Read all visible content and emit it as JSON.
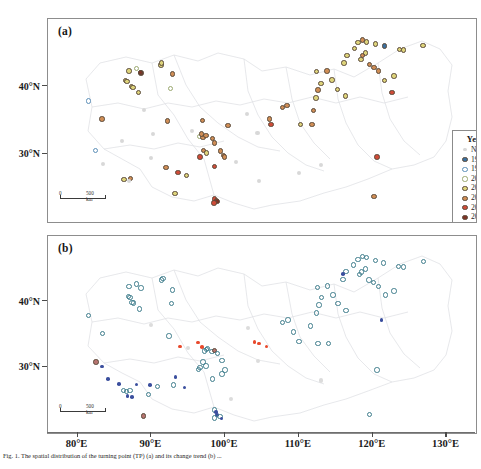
{
  "figure": {
    "panel_a_label": "(a)",
    "panel_b_label": "(b)",
    "scalebar_zero": "0",
    "scalebar_len": "500 km",
    "caption": "Fig. 1.  The spatial distribution of the turning point (TP) (a) and its change trend (b) ..."
  },
  "axes": {
    "x_ticks": [
      "80°E",
      "90°E",
      "100°E",
      "110°E",
      "120°E",
      "130°E"
    ],
    "x_values": [
      80,
      90,
      100,
      110,
      120,
      130
    ],
    "y_ticks": [
      "40°N",
      "30°N"
    ],
    "y_values": [
      40,
      30
    ],
    "xlim": [
      76,
      134
    ],
    "ylim_a": [
      20,
      50
    ],
    "ylim_b": [
      20,
      50
    ]
  },
  "legend_a": {
    "title": "Year of TP",
    "items": [
      {
        "label": "No TP",
        "color": "#d8d8d8",
        "style": "faint"
      },
      {
        "label": "1994",
        "color": "#3b6f9e",
        "style": "fill"
      },
      {
        "label": "1996",
        "color": "#5c8fb8",
        "style": "ring"
      },
      {
        "label": "2002",
        "color": "#9aa86f",
        "style": "ring"
      },
      {
        "label": "2003",
        "color": "#ddd37a",
        "style": "fill"
      },
      {
        "label": "2004",
        "color": "#cf8d55",
        "style": "fill"
      },
      {
        "label": "2005",
        "color": "#cf4b38",
        "style": "fill"
      },
      {
        "label": "2007",
        "color": "#7d3426",
        "style": "fill"
      }
    ]
  },
  "legend_b": {
    "title": "Change Trend",
    "items": [
      {
        "label": "Downward trend",
        "color": "#3b4f9e",
        "style": "dot"
      },
      {
        "label": "Upward trend",
        "color": "#e8492c",
        "style": "dot"
      },
      {
        "label": "First upward,\nthen downward",
        "color": "#3f7d8c",
        "style": "ring"
      },
      {
        "label": "First downward,\nthen upward",
        "color": "#b5736f",
        "style": "fill"
      },
      {
        "label": "Normal fluctuation",
        "color": "#dcdcdc",
        "style": "faint"
      }
    ]
  },
  "chart_data": {
    "type": "scatter",
    "xlabel": "Longitude",
    "ylabel": "Latitude",
    "grid": false,
    "panels": [
      {
        "id": "a",
        "label": "(a)",
        "legend_title": "Year of TP",
        "legend_position": "right-inside",
        "categories": [
          "No TP",
          "1994",
          "1996",
          "2002",
          "2003",
          "2004",
          "2005",
          "2007"
        ],
        "points": [
          [
            81.5,
            37.9,
            "1996"
          ],
          [
            83.3,
            35.2,
            "2004"
          ],
          [
            82.4,
            30.6,
            "1996"
          ],
          [
            83.4,
            28.6,
            "-"
          ],
          [
            86.5,
            40.9,
            "2003"
          ],
          [
            86.7,
            40.8,
            "2003"
          ],
          [
            87.3,
            40.0,
            "2003"
          ],
          [
            87.5,
            39.9,
            "2003"
          ],
          [
            87.0,
            42.3,
            "2003"
          ],
          [
            88.0,
            42.7,
            "2002"
          ],
          [
            88.6,
            42.0,
            "2007"
          ],
          [
            88.5,
            42.1,
            "2007"
          ],
          [
            88.3,
            39.1,
            "2003"
          ],
          [
            86.3,
            26.3,
            "2003"
          ],
          [
            87.2,
            26.4,
            "2004"
          ],
          [
            87.0,
            26.0,
            "-"
          ],
          [
            91.3,
            43.2,
            "2003"
          ],
          [
            91.4,
            43.5,
            "2003"
          ],
          [
            92.9,
            41.9,
            "2004"
          ],
          [
            92.6,
            39.7,
            "2002"
          ],
          [
            92.2,
            34.9,
            "2004"
          ],
          [
            93.6,
            27.3,
            "2005"
          ],
          [
            94.8,
            26.9,
            "2003"
          ],
          [
            93.2,
            24.2,
            "2003"
          ],
          [
            92.0,
            28.1,
            "2004"
          ],
          [
            96.5,
            32.6,
            "2002"
          ],
          [
            97.0,
            32.5,
            "2004"
          ],
          [
            97.4,
            32.8,
            "2004"
          ],
          [
            97.1,
            30.6,
            "2004"
          ],
          [
            97.5,
            30.2,
            "2003"
          ],
          [
            96.6,
            29.6,
            "2005"
          ],
          [
            96.8,
            33.0,
            "2004"
          ],
          [
            98.3,
            32.3,
            "2004"
          ],
          [
            98.6,
            31.7,
            "2004"
          ],
          [
            99.4,
            30.5,
            "2004"
          ],
          [
            99.8,
            29.8,
            "2004"
          ],
          [
            99.9,
            29.6,
            "2004"
          ],
          [
            98.6,
            28.2,
            "2005"
          ],
          [
            98.6,
            23.4,
            "2005"
          ],
          [
            98.8,
            23.2,
            "2005"
          ],
          [
            98.9,
            23.0,
            "2007"
          ],
          [
            98.5,
            22.8,
            "2005"
          ],
          [
            96.9,
            35.0,
            "2004"
          ],
          [
            100.4,
            34.3,
            "2004"
          ],
          [
            107.8,
            36.9,
            "2004"
          ],
          [
            108.4,
            37.2,
            "2004"
          ],
          [
            106.0,
            35.2,
            "2004"
          ],
          [
            106.2,
            34.4,
            "2005"
          ],
          [
            110.2,
            34.4,
            "2003"
          ],
          [
            111.8,
            34.4,
            "2004"
          ],
          [
            112.3,
            38.3,
            "2003"
          ],
          [
            112.0,
            36.5,
            "2004"
          ],
          [
            112.6,
            39.5,
            "2004"
          ],
          [
            113.0,
            40.5,
            "2003"
          ],
          [
            112.4,
            42.2,
            "2003"
          ],
          [
            113.8,
            42.3,
            "2004"
          ],
          [
            114.5,
            41.0,
            "2003"
          ],
          [
            115.2,
            39.6,
            "2003"
          ],
          [
            116.3,
            38.6,
            "2003"
          ],
          [
            116.1,
            43.5,
            "2003"
          ],
          [
            116.5,
            44.6,
            "2003"
          ],
          [
            117.5,
            45.6,
            "2003"
          ],
          [
            118.0,
            46.5,
            "2003"
          ],
          [
            118.6,
            46.9,
            "2004"
          ],
          [
            119.2,
            46.6,
            "2003"
          ],
          [
            119.0,
            45.0,
            "2003"
          ],
          [
            118.6,
            44.6,
            "2004"
          ],
          [
            118.4,
            44.0,
            "2003"
          ],
          [
            119.6,
            43.3,
            "2004"
          ],
          [
            120.2,
            42.8,
            "2004"
          ],
          [
            120.8,
            42.3,
            "2004"
          ],
          [
            120.4,
            46.3,
            "2003"
          ],
          [
            121.6,
            46.0,
            "1994"
          ],
          [
            121.6,
            40.9,
            "2003"
          ],
          [
            122.9,
            41.6,
            "2003"
          ],
          [
            123.6,
            45.5,
            "2003"
          ],
          [
            124.2,
            45.4,
            "2003"
          ],
          [
            122.6,
            39.1,
            "2005"
          ],
          [
            126.8,
            46.1,
            "2003"
          ],
          [
            120.6,
            29.6,
            "2005"
          ],
          [
            120.2,
            23.8,
            "2004"
          ],
          [
            104.6,
            26.1,
            "-"
          ],
          [
            110.0,
            27.2,
            "-"
          ],
          [
            113.0,
            28.4,
            "-"
          ],
          [
            101.5,
            28.9,
            "-"
          ],
          [
            89.0,
            36.5,
            "-"
          ],
          [
            90.2,
            33.0,
            "-"
          ],
          [
            95.5,
            33.5,
            "-"
          ],
          [
            103.0,
            36.0,
            "-"
          ],
          [
            104.4,
            33.1,
            "-"
          ],
          [
            86.0,
            32.0,
            "-"
          ],
          [
            90.0,
            29.5,
            "-"
          ]
        ]
      },
      {
        "id": "b",
        "label": "(b)",
        "legend_title": "Change Trend",
        "legend_position": "right-inside",
        "categories": [
          "Downward trend",
          "Upward trend",
          "First upward, then downward",
          "First downward, then upward",
          "Normal fluctuation"
        ],
        "points": [
          [
            81.5,
            37.9,
            "fud"
          ],
          [
            83.4,
            35.2,
            "fud"
          ],
          [
            82.5,
            30.8,
            "fdu"
          ],
          [
            83.3,
            30.1,
            "down"
          ],
          [
            84.1,
            28.2,
            "down"
          ],
          [
            86.2,
            26.5,
            "fud"
          ],
          [
            86.6,
            26.3,
            "fud"
          ],
          [
            87.1,
            26.5,
            "fud"
          ],
          [
            86.8,
            25.6,
            "down"
          ],
          [
            87.4,
            25.5,
            "down"
          ],
          [
            85.6,
            27.5,
            "down"
          ],
          [
            88.0,
            27.4,
            "down"
          ],
          [
            89.8,
            27.3,
            "down"
          ],
          [
            90.8,
            27.1,
            "fud"
          ],
          [
            89.6,
            25.9,
            "fud"
          ],
          [
            88.9,
            22.6,
            "fdu"
          ],
          [
            86.9,
            40.8,
            "fud"
          ],
          [
            87.1,
            40.6,
            "fud"
          ],
          [
            87.4,
            39.9,
            "fud"
          ],
          [
            87.6,
            39.8,
            "fud"
          ],
          [
            87.0,
            42.3,
            "fud"
          ],
          [
            88.0,
            42.7,
            "fud"
          ],
          [
            88.6,
            42.1,
            "fud"
          ],
          [
            88.4,
            38.9,
            "fud"
          ],
          [
            91.4,
            43.3,
            "fud"
          ],
          [
            91.6,
            43.5,
            "fud"
          ],
          [
            92.9,
            41.8,
            "fud"
          ],
          [
            92.7,
            39.7,
            "fud"
          ],
          [
            92.4,
            34.8,
            "fud"
          ],
          [
            93.9,
            33.2,
            "up"
          ],
          [
            93.3,
            28.5,
            "down"
          ],
          [
            93.0,
            27.3,
            "fud"
          ],
          [
            94.5,
            26.9,
            "down"
          ],
          [
            96.3,
            33.8,
            "up"
          ],
          [
            96.9,
            33.1,
            "up"
          ],
          [
            97.2,
            32.5,
            "fud"
          ],
          [
            97.5,
            32.7,
            "fud"
          ],
          [
            97.6,
            32.9,
            "fud"
          ],
          [
            98.2,
            32.4,
            "fud"
          ],
          [
            98.6,
            32.6,
            "fdu"
          ],
          [
            99.0,
            32.1,
            "fud"
          ],
          [
            99.6,
            31.0,
            "fud"
          ],
          [
            97.0,
            30.8,
            "fud"
          ],
          [
            97.4,
            30.2,
            "fud"
          ],
          [
            96.6,
            30.0,
            "fud"
          ],
          [
            96.4,
            29.7,
            "fud"
          ],
          [
            100.0,
            29.6,
            "fud"
          ],
          [
            99.6,
            29.0,
            "fud"
          ],
          [
            98.3,
            28.2,
            "fud"
          ],
          [
            98.6,
            23.5,
            "fud"
          ],
          [
            98.8,
            23.2,
            "down"
          ],
          [
            98.9,
            22.7,
            "down"
          ],
          [
            98.6,
            22.3,
            "fud"
          ],
          [
            99.3,
            22.5,
            "fud"
          ],
          [
            99.5,
            22.2,
            "down"
          ],
          [
            104.0,
            33.9,
            "up"
          ],
          [
            104.6,
            33.6,
            "up"
          ],
          [
            105.6,
            33.2,
            "up"
          ],
          [
            107.8,
            36.8,
            "fud"
          ],
          [
            108.5,
            37.2,
            "fud"
          ],
          [
            109.3,
            35.4,
            "fud"
          ],
          [
            110.0,
            33.9,
            "fud"
          ],
          [
            112.6,
            33.6,
            "fud"
          ],
          [
            114.0,
            33.6,
            "fud"
          ],
          [
            112.4,
            38.3,
            "fud"
          ],
          [
            111.6,
            36.3,
            "fud"
          ],
          [
            112.7,
            39.5,
            "fud"
          ],
          [
            113.1,
            40.6,
            "fud"
          ],
          [
            112.5,
            42.2,
            "fud"
          ],
          [
            113.9,
            42.4,
            "fud"
          ],
          [
            114.6,
            41.0,
            "fud"
          ],
          [
            115.3,
            39.7,
            "fud"
          ],
          [
            116.4,
            38.7,
            "fud"
          ],
          [
            116.0,
            43.4,
            "fud"
          ],
          [
            116.4,
            44.6,
            "fud"
          ],
          [
            117.4,
            45.6,
            "fud"
          ],
          [
            118.0,
            46.4,
            "fud"
          ],
          [
            118.6,
            46.9,
            "fud"
          ],
          [
            119.2,
            46.7,
            "fud"
          ],
          [
            119.0,
            45.0,
            "fud"
          ],
          [
            118.5,
            44.5,
            "fud"
          ],
          [
            118.2,
            44.1,
            "fud"
          ],
          [
            119.5,
            43.3,
            "fud"
          ],
          [
            120.1,
            42.9,
            "fud"
          ],
          [
            120.8,
            42.3,
            "fud"
          ],
          [
            120.4,
            46.3,
            "fud"
          ],
          [
            121.5,
            45.9,
            "fud"
          ],
          [
            121.2,
            37.2,
            "down"
          ],
          [
            121.7,
            41.0,
            "fud"
          ],
          [
            122.9,
            41.6,
            "fud"
          ],
          [
            123.5,
            45.4,
            "fud"
          ],
          [
            124.2,
            45.3,
            "fud"
          ],
          [
            126.9,
            46.1,
            "fud"
          ],
          [
            120.6,
            29.6,
            "fud"
          ],
          [
            119.6,
            22.8,
            "fud"
          ],
          [
            116.0,
            44.2,
            "down"
          ],
          [
            103.1,
            36.0,
            "norm"
          ],
          [
            104.5,
            31.0,
            "norm"
          ],
          [
            100.8,
            25.2,
            "norm"
          ],
          [
            113.0,
            28.0,
            "norm"
          ],
          [
            90.0,
            36.5,
            "norm"
          ],
          [
            95.0,
            33.0,
            "norm"
          ]
        ]
      }
    ]
  }
}
